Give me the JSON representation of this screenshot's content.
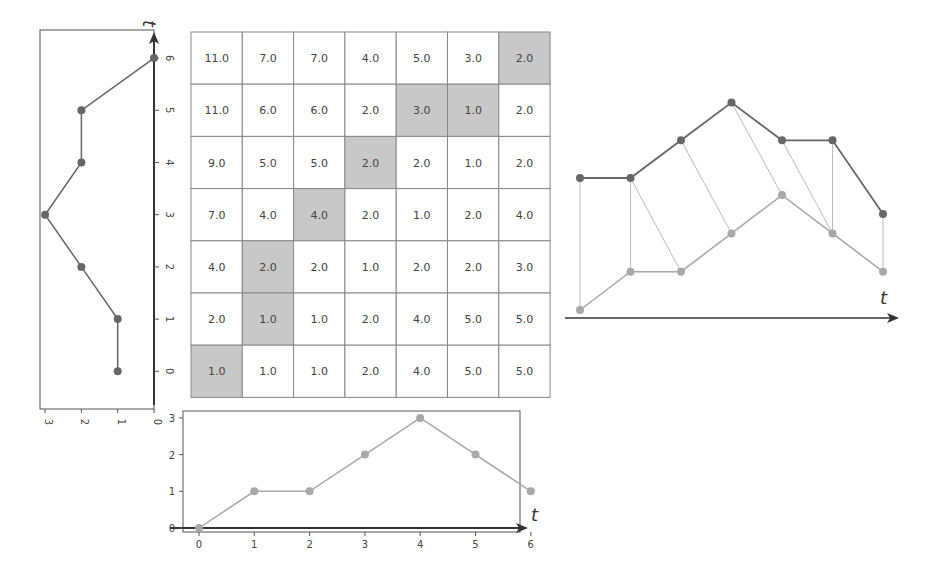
{
  "diagram": {
    "title": "",
    "time_label": "t",
    "colors": {
      "series_a": "#666666",
      "series_b": "#a8a8a8",
      "path_cell": "#c8c8c8",
      "grid": "#888888",
      "axis": "#333333",
      "match_line": "#bbbbbb"
    }
  },
  "chart_data": [
    {
      "type": "line",
      "name": "left-series",
      "orientation": "vertical",
      "x": [
        0,
        1,
        2,
        3,
        4,
        5,
        6
      ],
      "values": [
        1,
        1,
        2,
        3,
        2,
        2,
        0
      ],
      "xlabel": "t",
      "x_ticks": [
        "0",
        "1",
        "2",
        "3",
        "4",
        "5",
        "6"
      ],
      "y_ticks": [
        "3",
        "2",
        "1",
        "0"
      ],
      "ylim": [
        0,
        3
      ]
    },
    {
      "type": "line",
      "name": "bottom-series",
      "x": [
        0,
        1,
        2,
        3,
        4,
        5,
        6
      ],
      "values": [
        0,
        1,
        1,
        2,
        3,
        2,
        1
      ],
      "xlabel": "t",
      "x_ticks": [
        "0",
        "1",
        "2",
        "3",
        "4",
        "5",
        "6"
      ],
      "y_ticks": [
        "0",
        "1",
        "2",
        "3"
      ],
      "ylim": [
        0,
        3
      ]
    },
    {
      "type": "table",
      "name": "cost-matrix",
      "rows_top_to_bottom": [
        [
          "11.0",
          "7.0",
          "7.0",
          "4.0",
          "5.0",
          "3.0",
          "2.0"
        ],
        [
          "11.0",
          "6.0",
          "6.0",
          "2.0",
          "3.0",
          "1.0",
          "2.0"
        ],
        [
          "9.0",
          "5.0",
          "5.0",
          "2.0",
          "2.0",
          "1.0",
          "2.0"
        ],
        [
          "7.0",
          "4.0",
          "4.0",
          "2.0",
          "1.0",
          "2.0",
          "4.0"
        ],
        [
          "4.0",
          "2.0",
          "2.0",
          "1.0",
          "2.0",
          "2.0",
          "3.0"
        ],
        [
          "2.0",
          "1.0",
          "1.0",
          "2.0",
          "4.0",
          "5.0",
          "5.0"
        ],
        [
          "1.0",
          "1.0",
          "1.0",
          "2.0",
          "4.0",
          "5.0",
          "5.0"
        ]
      ],
      "warping_path": [
        [
          0,
          0
        ],
        [
          1,
          1
        ],
        [
          2,
          1
        ],
        [
          3,
          2
        ],
        [
          4,
          3
        ],
        [
          5,
          4
        ],
        [
          5,
          5
        ],
        [
          6,
          6
        ]
      ]
    },
    {
      "type": "line",
      "name": "aligned-series",
      "x": [
        0,
        1,
        2,
        3,
        4,
        5,
        6
      ],
      "series": [
        {
          "name": "A",
          "values": [
            1,
            1,
            2,
            3,
            2,
            2,
            0
          ]
        },
        {
          "name": "B",
          "values": [
            0,
            1,
            1,
            2,
            3,
            2,
            1
          ]
        }
      ],
      "alignments": [
        [
          0,
          0
        ],
        [
          1,
          1
        ],
        [
          1,
          2
        ],
        [
          2,
          3
        ],
        [
          3,
          4
        ],
        [
          4,
          5
        ],
        [
          5,
          5
        ],
        [
          6,
          6
        ]
      ],
      "xlabel": "t"
    }
  ]
}
